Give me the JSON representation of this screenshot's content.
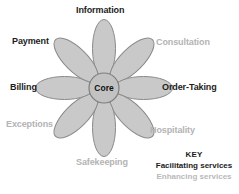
{
  "diagram": {
    "core": {
      "label": "Core"
    },
    "colors": {
      "background": "#ffffff",
      "petal_fill": "#c9c9c9",
      "petal_stroke": "#8a8a8a",
      "core_fill": "#c2c2c2",
      "core_stroke": "#7d7d7d",
      "facilitating_text": "#1c1c1c",
      "enhancing_text": "#b3b3b3"
    },
    "petals": [
      {
        "label": "Information",
        "category": "facilitating",
        "angle_deg": 0
      },
      {
        "label": "Consultation",
        "category": "enhancing",
        "angle_deg": 45
      },
      {
        "label": "Order-Taking",
        "category": "facilitating",
        "angle_deg": 90
      },
      {
        "label": "Hospitality",
        "category": "enhancing",
        "angle_deg": 135
      },
      {
        "label": "Safekeeping",
        "category": "enhancing",
        "angle_deg": 180
      },
      {
        "label": "Exceptions",
        "category": "enhancing",
        "angle_deg": 225
      },
      {
        "label": "Billing",
        "category": "facilitating",
        "angle_deg": 270
      },
      {
        "label": "Payment",
        "category": "facilitating",
        "angle_deg": 315
      }
    ]
  },
  "key": {
    "title": "KEY",
    "facilitating": "Facilitating services",
    "enhancing": "Enhancing services"
  }
}
